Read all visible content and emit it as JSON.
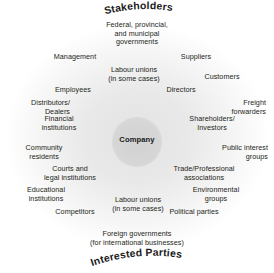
{
  "diagram": {
    "title_top": "Stakeholders",
    "title_bottom": "Interested Parties",
    "center": {
      "label": "Company",
      "shape": "circle",
      "fill": "#d6d6d6"
    },
    "background": {
      "page": "#ffffff",
      "wash_center": "#e3e3e3",
      "wash_edge": "#ffffff",
      "text_color": "#231f20"
    },
    "stakeholders": [
      {
        "id": "federal-provincial-municipal-governments",
        "text": "Federal, provincial,\nand municipal\ngovernments"
      },
      {
        "id": "management",
        "text": "Management"
      },
      {
        "id": "suppliers",
        "text": "Suppliers"
      },
      {
        "id": "labour-unions-top",
        "text": "Labour unions\n(in some cases)"
      },
      {
        "id": "customers",
        "text": "Customers"
      },
      {
        "id": "employees",
        "text": "Employees"
      },
      {
        "id": "directors",
        "text": "Directors"
      },
      {
        "id": "distributors-dealers",
        "text": "Distributors/\nDealers"
      },
      {
        "id": "freight-forwarders",
        "text": "Freight\nforwarders"
      },
      {
        "id": "financial-institutions",
        "text": "Financial\ninstitutions"
      },
      {
        "id": "shareholders-investors",
        "text": "Shareholders/\nInvestors"
      },
      {
        "id": "community-residents",
        "text": "Community\nresidents"
      },
      {
        "id": "public-interest-groups",
        "text": "Public interest\ngroups"
      },
      {
        "id": "courts-and-legal-institutions",
        "text": "Courts and\nlegal institutions"
      },
      {
        "id": "trade-professional-associations",
        "text": "Trade/Professional\nassociations"
      },
      {
        "id": "educational-institutions",
        "text": "Educational\ninstitutions"
      },
      {
        "id": "environmental-groups",
        "text": "Environmental\ngroups"
      },
      {
        "id": "labour-unions-bottom",
        "text": "Labour unions\n(in some cases)"
      },
      {
        "id": "competitors",
        "text": "Competitors"
      },
      {
        "id": "political-parties",
        "text": "Political parties"
      },
      {
        "id": "foreign-governments",
        "text": "Foreign governments\n(for international businesses)"
      }
    ]
  }
}
